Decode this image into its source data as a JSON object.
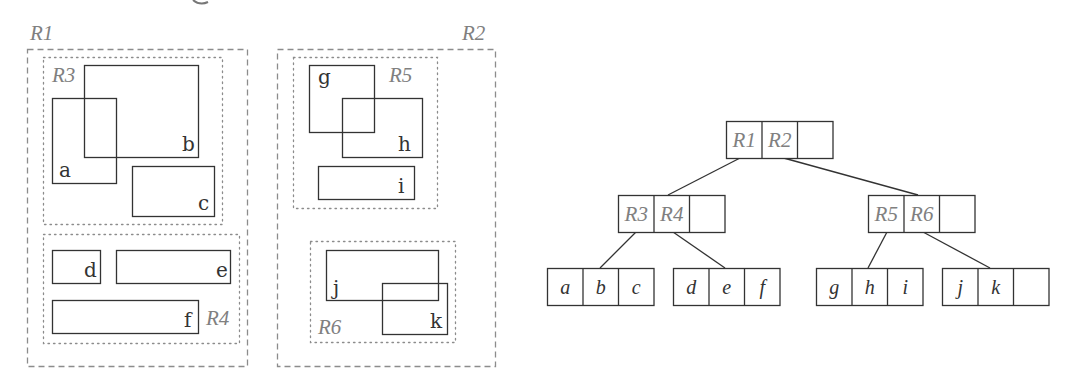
{
  "diagram": {
    "colors": {
      "ink": "#333333",
      "region_label": "#808080",
      "region_border": "#8c8c8c",
      "edge": "#333333"
    },
    "spatial": {
      "top_level_regions": [
        {
          "id": "R1",
          "label": "R1",
          "x": 27,
          "y": 49,
          "w": 220,
          "h": 317,
          "style": "dashed",
          "label_pos": {
            "x": 30,
            "y": 40
          }
        },
        {
          "id": "R2",
          "label": "R2",
          "x": 277,
          "y": 49,
          "w": 218,
          "h": 317,
          "style": "dashed",
          "label_pos": {
            "x": 462,
            "y": 40
          }
        }
      ],
      "sub_regions": [
        {
          "id": "R3",
          "label": "R3",
          "x": 43,
          "y": 57,
          "w": 179,
          "h": 167,
          "style": "dotted",
          "label_pos": {
            "x": 52,
            "y": 82
          }
        },
        {
          "id": "R4",
          "label": "R4",
          "x": 43,
          "y": 234,
          "w": 196,
          "h": 109,
          "style": "dotted",
          "label_pos": {
            "x": 206,
            "y": 325
          }
        },
        {
          "id": "R5",
          "label": "R5",
          "x": 293,
          "y": 57,
          "w": 144,
          "h": 151,
          "style": "dotted",
          "label_pos": {
            "x": 389,
            "y": 82
          }
        },
        {
          "id": "R6",
          "label": "R6",
          "x": 310,
          "y": 241,
          "w": 145,
          "h": 101,
          "style": "dotted",
          "label_pos": {
            "x": 318,
            "y": 334
          }
        }
      ],
      "objects": [
        {
          "id": "a",
          "label": "a",
          "x": 52,
          "y": 98,
          "w": 64,
          "h": 85,
          "label_pos": {
            "x": 59,
            "y": 177
          }
        },
        {
          "id": "b",
          "label": "b",
          "x": 84,
          "y": 65,
          "w": 114,
          "h": 92,
          "label_pos": {
            "x": 182,
            "y": 151
          }
        },
        {
          "id": "c",
          "label": "c",
          "x": 132,
          "y": 166,
          "w": 82,
          "h": 50,
          "label_pos": {
            "x": 198,
            "y": 210
          }
        },
        {
          "id": "d",
          "label": "d",
          "x": 52,
          "y": 250,
          "w": 48,
          "h": 33,
          "label_pos": {
            "x": 84,
            "y": 277
          }
        },
        {
          "id": "e",
          "label": "e",
          "x": 116,
          "y": 250,
          "w": 114,
          "h": 33,
          "label_pos": {
            "x": 216,
            "y": 277
          }
        },
        {
          "id": "f",
          "label": "f",
          "x": 52,
          "y": 300,
          "w": 146,
          "h": 33,
          "label_pos": {
            "x": 184,
            "y": 327
          }
        },
        {
          "id": "g",
          "label": "g",
          "x": 309,
          "y": 65,
          "w": 65,
          "h": 67,
          "label_pos": {
            "x": 318,
            "y": 84
          }
        },
        {
          "id": "h",
          "label": "h",
          "x": 342,
          "y": 98,
          "w": 80,
          "h": 59,
          "label_pos": {
            "x": 398,
            "y": 151
          }
        },
        {
          "id": "i",
          "label": "i",
          "x": 318,
          "y": 166,
          "w": 96,
          "h": 33,
          "label_pos": {
            "x": 398,
            "y": 193
          }
        },
        {
          "id": "j",
          "label": "j",
          "x": 326,
          "y": 250,
          "w": 112,
          "h": 50,
          "label_pos": {
            "x": 333,
            "y": 295
          }
        },
        {
          "id": "k",
          "label": "k",
          "x": 382,
          "y": 283,
          "w": 65,
          "h": 51,
          "label_pos": {
            "x": 430,
            "y": 328
          }
        }
      ]
    },
    "tree": {
      "cell_w": 35.5,
      "cell_h": 37,
      "nodes": [
        {
          "id": "root",
          "x": 726,
          "y": 121,
          "entries": [
            "R1",
            "R2",
            ""
          ],
          "kind": "region"
        },
        {
          "id": "n-R3R4",
          "x": 618,
          "y": 195,
          "entries": [
            "R3",
            "R4",
            ""
          ],
          "kind": "region"
        },
        {
          "id": "n-R5R6",
          "x": 868,
          "y": 195,
          "entries": [
            "R5",
            "R6",
            ""
          ],
          "kind": "region"
        },
        {
          "id": "leaf-abc",
          "x": 547,
          "y": 268,
          "entries": [
            "a",
            "b",
            "c"
          ],
          "kind": "object"
        },
        {
          "id": "leaf-def",
          "x": 673,
          "y": 268,
          "entries": [
            "d",
            "e",
            "f"
          ],
          "kind": "object"
        },
        {
          "id": "leaf-ghi",
          "x": 816,
          "y": 268,
          "entries": [
            "g",
            "h",
            "i"
          ],
          "kind": "object"
        },
        {
          "id": "leaf-jk",
          "x": 942,
          "y": 268,
          "entries": [
            "j",
            "k",
            ""
          ],
          "kind": "object"
        }
      ],
      "edges": [
        {
          "from": "root.R1",
          "to": "n-R3R4",
          "x1": 742,
          "y1": 157,
          "x2": 668,
          "y2": 195
        },
        {
          "from": "root.R2",
          "to": "n-R5R6",
          "x1": 780,
          "y1": 157,
          "x2": 918,
          "y2": 195
        },
        {
          "from": "n-R3R4.R3",
          "to": "leaf-abc",
          "x1": 636,
          "y1": 232,
          "x2": 600,
          "y2": 268
        },
        {
          "from": "n-R3R4.R4",
          "to": "leaf-def",
          "x1": 673,
          "y1": 232,
          "x2": 725,
          "y2": 268
        },
        {
          "from": "n-R5R6.R5",
          "to": "leaf-ghi",
          "x1": 887,
          "y1": 232,
          "x2": 868,
          "y2": 268
        },
        {
          "from": "n-R5R6.R6",
          "to": "leaf-jk",
          "x1": 923,
          "y1": 232,
          "x2": 990,
          "y2": 268
        }
      ]
    }
  }
}
